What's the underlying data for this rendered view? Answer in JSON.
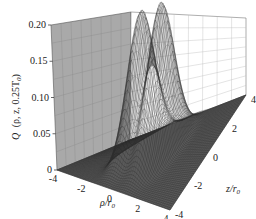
{
  "chart_data": {
    "type": "surface3d",
    "title": "",
    "zlabel": "Q(ρ, z, 0.25T₀)",
    "xlabel": "ρ/r₀",
    "ylabel": "z/r₀",
    "x_ticks": [
      "-4",
      "-2",
      "0",
      "2",
      "4"
    ],
    "y_ticks": [
      "-4",
      "-2",
      "0",
      "2",
      "4"
    ],
    "z_ticks": [
      "0",
      "0.05",
      "0.10",
      "0.15",
      "0.20"
    ],
    "xlim": [
      -4,
      4
    ],
    "ylim": [
      -4,
      4
    ],
    "zlim": [
      0,
      0.2
    ],
    "grid": true,
    "peaks": [
      {
        "rho": -0.7,
        "z": 0,
        "value": 0.19
      },
      {
        "rho": 0.7,
        "z": 0,
        "value": 0.2
      }
    ]
  },
  "labels": {
    "zlabel_Q": "Q",
    "zlabel_args": "(ρ, z, 0.25T",
    "zlabel_sub": "0",
    "zlabel_close": ")",
    "xlabel_main": "ρ/r",
    "xlabel_sub": "0",
    "ylabel_main": "z/r",
    "ylabel_sub": "0"
  }
}
